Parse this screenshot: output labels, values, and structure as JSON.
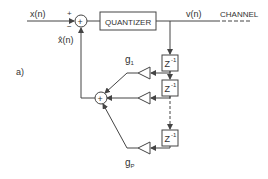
{
  "diagram": {
    "panel_label": "a)",
    "input_label": "x(n)",
    "prediction_label": "x̂(n)",
    "plus_sign": "+",
    "minus_sign": "−",
    "quantizer_label": "QUANTIZER",
    "output_label": "v(n)",
    "channel_label": "CHANNEL",
    "delay_label": "Z",
    "delay_exp": "-1",
    "gain_first": "g",
    "gain_first_sub": "1",
    "gain_last": "g",
    "gain_last_sub": "P",
    "summer_glyph": "+",
    "colors": {
      "line": "#444444",
      "background": "#ffffff"
    }
  }
}
